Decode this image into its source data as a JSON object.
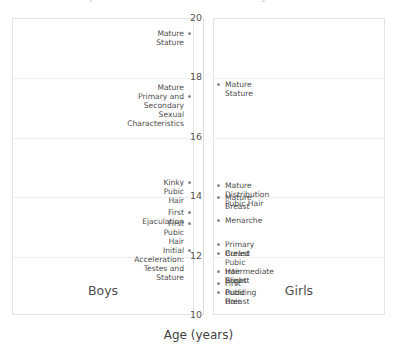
{
  "chart_data": {
    "type": "scatter",
    "title": "Sequence of Pubertal Events in Boys and Girls",
    "xlabel": "Age (years)",
    "ylabel": "",
    "ylim": [
      10,
      20
    ],
    "yticks": [
      20,
      18,
      16,
      14,
      12,
      10
    ],
    "grid": true,
    "legend": "none",
    "panels": [
      {
        "name": "Boys",
        "caption": "Boys",
        "align": "right",
        "events": [
          {
            "label": "Mature Stature",
            "age": 19.5
          },
          {
            "label": "Mature Primary and\nSecondary Sexual Characteristics",
            "age": 17.4
          },
          {
            "label": "Kinky Pubic Hair",
            "age": 14.5
          },
          {
            "label": "First Ejaculation",
            "age": 13.5
          },
          {
            "label": "First Pubic Hair",
            "age": 13.1
          },
          {
            "label": "Initial Acceleration: Testes and Stature",
            "age": 12.2
          }
        ]
      },
      {
        "name": "Girls",
        "caption": "Girls",
        "align": "left",
        "events": [
          {
            "label": "Mature Stature",
            "age": 17.8
          },
          {
            "label": "Mature Distribution Pubic Hair",
            "age": 14.4
          },
          {
            "label": "Mature Breast",
            "age": 14.0
          },
          {
            "label": "Menarche",
            "age": 13.2
          },
          {
            "label": "Primary Breast",
            "age": 12.4
          },
          {
            "label": "Curled Pubic Hair Slight",
            "age": 12.1
          },
          {
            "label": "Intermediate Breast",
            "age": 11.5
          },
          {
            "label": "First Pubic Hair",
            "age": 11.1
          },
          {
            "label": "Budding Breast",
            "age": 10.8
          }
        ]
      }
    ]
  }
}
